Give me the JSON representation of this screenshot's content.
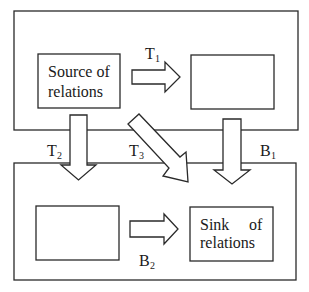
{
  "diagram": {
    "upper_region": {
      "source_box": {
        "line1": "Source of",
        "line2": "relations"
      },
      "empty_box": {},
      "arrow_T1": {
        "label": "T",
        "sub": "1"
      }
    },
    "lower_region": {
      "empty_box": {},
      "sink_box": {
        "line1": "Sink",
        "line1b": "of",
        "line2": "relations"
      },
      "arrow_B2": {
        "label": "B",
        "sub": "2"
      }
    },
    "cross_arrows": {
      "T2": {
        "label": "T",
        "sub": "2"
      },
      "T3": {
        "label": "T",
        "sub": "3"
      },
      "B1": {
        "label": "B",
        "sub": "1"
      }
    },
    "colors": {
      "stroke": "#2a2a2a",
      "fill": "#ffffff",
      "text": "#1a1a1a"
    }
  }
}
